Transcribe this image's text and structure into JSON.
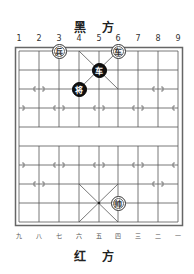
{
  "top_label": "黑 方",
  "bottom_label": "红 方",
  "top_columns": [
    "1",
    "2",
    "3",
    "4",
    "5",
    "6",
    "7",
    "8",
    "9"
  ],
  "bottom_columns": [
    "九",
    "八",
    "七",
    "六",
    "五",
    "四",
    "三",
    "二",
    "一"
  ],
  "board": {
    "files": 9,
    "ranks": 10,
    "line_color": "#555555",
    "border_color": "#666666"
  },
  "pieces": [
    {
      "side": "red",
      "char": "兵",
      "name": "soldier",
      "file": 3,
      "rank": 0
    },
    {
      "side": "red",
      "char": "车",
      "name": "chariot",
      "file": 6,
      "rank": 0
    },
    {
      "side": "black",
      "char": "车",
      "name": "chariot",
      "file": 5,
      "rank": 1
    },
    {
      "side": "black",
      "char": "将",
      "name": "general",
      "file": 4,
      "rank": 2
    },
    {
      "side": "red",
      "char": "帅",
      "name": "general",
      "file": 6,
      "rank": 8
    }
  ]
}
